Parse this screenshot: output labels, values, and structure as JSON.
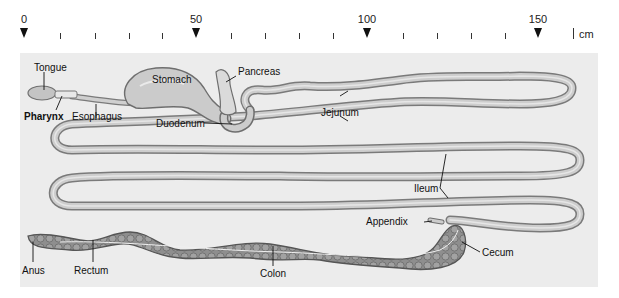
{
  "ruler": {
    "unit": "cm",
    "major_ticks": [
      {
        "label": "0",
        "x": 24
      },
      {
        "label": "50",
        "x": 196
      },
      {
        "label": "100",
        "x": 367
      },
      {
        "label": "150",
        "x": 538
      }
    ],
    "minor_tick_xs": [
      60,
      95,
      129,
      162,
      231,
      265,
      299,
      333,
      403,
      437,
      471,
      505
    ]
  },
  "labels": {
    "tongue": "Tongue",
    "pharynx": "Pharynx",
    "esophagus": "Esophagus",
    "stomach": "Stomach",
    "pancreas": "Pancreas",
    "duodenum": "Duodenum",
    "jejunum": "Jejunum",
    "ileum": "Ileum",
    "appendix": "Appendix",
    "cecum": "Cecum",
    "colon": "Colon",
    "rectum": "Rectum",
    "anus": "Anus"
  },
  "colors": {
    "background": "#ececec",
    "tube_fill": "#c8c8c8",
    "tube_edge": "#7a7a7a",
    "colon_fill": "#8e8e8e",
    "colon_edge": "#555555"
  }
}
